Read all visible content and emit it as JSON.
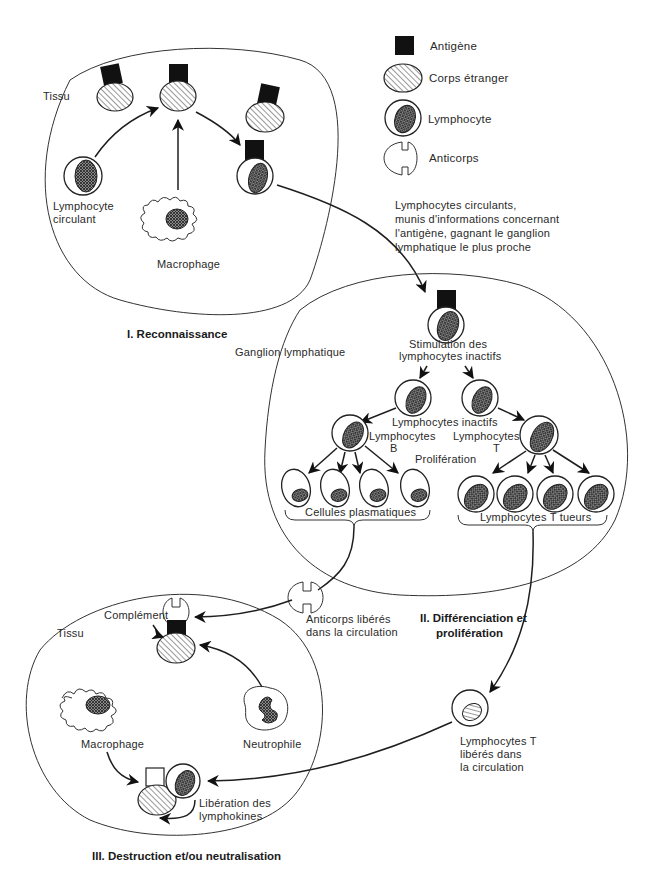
{
  "legend": {
    "items": [
      {
        "icon": "antigen-icon",
        "label": "Antigène"
      },
      {
        "icon": "foreign-body-icon",
        "label": "Corps étranger"
      },
      {
        "icon": "lymphocyte-icon",
        "label": "Lymphocyte"
      },
      {
        "icon": "antibody-icon",
        "label": "Anticorps"
      }
    ]
  },
  "stage1": {
    "title": "I.  Reconnaissance",
    "tissue_label": "Tissu",
    "lymphocyte_label": [
      "Lymphocyte",
      "circulant"
    ],
    "macrophage_label": "Macrophage"
  },
  "transfer_note": {
    "lines": [
      "Lymphocytes circulants,",
      "munis d'informations concernant",
      "l'antigène, gagnant le ganglion",
      "lymphatique le plus proche"
    ]
  },
  "stage2": {
    "title_line1": "II.  Différenciation et",
    "title_line2": "prolifération",
    "node_label": "Ganglion lymphatique",
    "stimulation_label": [
      "Stimulation des",
      "lymphocytes inactifs"
    ],
    "inactive_label": "Lymphocytes inactifs",
    "b_label": [
      "Lymphocytes",
      "B"
    ],
    "t_label": [
      "Lymphocytes",
      "T"
    ],
    "proliferation_label": "Prolifération",
    "plasma_cells_label": "Cellules plasmatiques",
    "killer_t_label": "Lymphocytes T tueurs"
  },
  "released_antibodies": {
    "lines": [
      "Anticorps libérés",
      "dans la circulation"
    ]
  },
  "released_t": {
    "lines": [
      "Lymphocytes T",
      "libérés dans",
      "la circulation"
    ]
  },
  "stage3": {
    "title": "III.  Destruction et/ou neutralisation",
    "tissue_label": "Tissu",
    "complement_label": "Complément",
    "macrophage_label": "Macrophage",
    "neutrophil_label": "Neutrophile",
    "lymphokines_label": [
      "Libération des",
      "lymphokines"
    ]
  }
}
